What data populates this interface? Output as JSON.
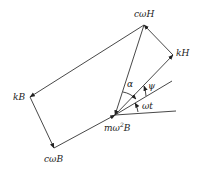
{
  "diagram": {
    "type": "phasor-vector-diagram",
    "colors": {
      "line": "#333333",
      "text": "#222222",
      "background": "#ffffff"
    },
    "labels": {
      "cwH": "cωH",
      "kH": "kH",
      "kB": "kB",
      "cwB": "cωB",
      "mw2B_prefix": "mω",
      "mw2B_sup": "2",
      "mw2B_suffix": "B",
      "alpha": "α",
      "psi": "ψ",
      "wt": "ωt"
    },
    "points": {
      "origin": [
        115,
        115
      ],
      "cwH": [
        144,
        25
      ],
      "kH": [
        173,
        55
      ],
      "kB": [
        30,
        97
      ],
      "cwB": [
        54,
        148
      ],
      "wt_end": [
        176,
        111
      ],
      "psi_end": [
        172,
        81
      ]
    },
    "vectors": [
      {
        "name": "origin-to-kH",
        "from": "origin",
        "to": "kH"
      },
      {
        "name": "kH-to-cwH",
        "from": "kH",
        "to": "cwH"
      },
      {
        "name": "cwH-to-kB",
        "from": "cwH",
        "to": "kB"
      },
      {
        "name": "kB-to-cwB",
        "from": "kB",
        "to": "cwB"
      },
      {
        "name": "cwB-to-origin",
        "from": "cwB",
        "to": "origin"
      },
      {
        "name": "cwH-to-origin",
        "from": "cwH",
        "to": "origin"
      }
    ],
    "angles": [
      {
        "name": "alpha",
        "between": [
          "cwH-direction",
          "psi-line"
        ]
      },
      {
        "name": "psi",
        "between": [
          "psi-line",
          "kH-direction"
        ]
      },
      {
        "name": "wt",
        "between": [
          "wt-line",
          "psi-line"
        ]
      }
    ]
  }
}
